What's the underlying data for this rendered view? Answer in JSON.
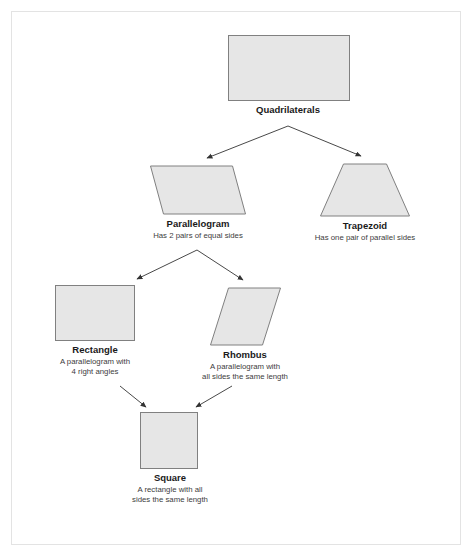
{
  "diagram": {
    "colors": {
      "shape_fill": "#e6e6e6",
      "shape_stroke": "#808080",
      "edge_stroke": "#333333",
      "frame_border": "#e3e3e3",
      "title_text": "#1a1a1a",
      "desc_text": "#3d3d3d",
      "background": "#ffffff"
    },
    "nodes": [
      {
        "id": "quadrilaterals",
        "shape": "rectangle",
        "title": "Quadrilaterals",
        "desc": ""
      },
      {
        "id": "parallelogram",
        "shape": "parallelogram",
        "title": "Parallelogram",
        "desc": "Has 2 pairs of equal sides"
      },
      {
        "id": "trapezoid",
        "shape": "trapezoid",
        "title": "Trapezoid",
        "desc": "Has one pair of parallel sides"
      },
      {
        "id": "rectangle",
        "shape": "rectangle",
        "title": "Rectangle",
        "desc_line1": "A parallelogram with",
        "desc_line2": "4 right angles"
      },
      {
        "id": "rhombus",
        "shape": "rhombus",
        "title": "Rhombus",
        "desc_line1": "A parallelogram with",
        "desc_line2": "all sides the same length"
      },
      {
        "id": "square",
        "shape": "square",
        "title": "Square",
        "desc_line1": "A rectangle with all",
        "desc_line2": "sides the same length"
      }
    ],
    "edges": [
      {
        "from": "quadrilaterals",
        "to": "parallelogram"
      },
      {
        "from": "quadrilaterals",
        "to": "trapezoid"
      },
      {
        "from": "parallelogram",
        "to": "rectangle"
      },
      {
        "from": "parallelogram",
        "to": "rhombus"
      },
      {
        "from": "rectangle",
        "to": "square"
      },
      {
        "from": "rhombus",
        "to": "square"
      }
    ]
  }
}
